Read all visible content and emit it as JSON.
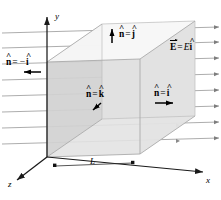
{
  "figure": {
    "type": "physics-diagram",
    "background_color": "#ffffff",
    "line_color": "#6e6e6e",
    "axis_color": "#1a1a1a",
    "cube_face_colors": {
      "top": "#f2f2f2",
      "front_right": "#e4e4e4",
      "left_shaded": "#cfcfcf",
      "inner_back": "#dcdcdc"
    }
  },
  "axes": [
    {
      "name": "y-axis",
      "label": "y",
      "direction": "up",
      "x": 160,
      "y": 10
    },
    {
      "name": "x-axis",
      "label": "x",
      "direction": "right",
      "x": 206,
      "y": 180
    },
    {
      "name": "z-axis",
      "label": "z",
      "direction": "down-left",
      "x": 10,
      "y": 182
    }
  ],
  "labels": {
    "normal_top": {
      "n": "n",
      "eq": "=",
      "v": "j",
      "hat_n": "^",
      "hat_v": "^",
      "x": 118,
      "y": 31
    },
    "normal_left": {
      "n": "n",
      "eq": "=",
      "minus": "−",
      "v": "i",
      "hat_n": "^",
      "hat_v": "^",
      "x": 6,
      "y": 60
    },
    "normal_front": {
      "n": "n",
      "eq": "=",
      "v": "k",
      "hat_n": "^",
      "hat_v": "^",
      "x": 86,
      "y": 92
    },
    "normal_right": {
      "n": "n",
      "eq": "=",
      "v": "i",
      "hat_n": "^",
      "hat_v": "^",
      "x": 154,
      "y": 91
    },
    "field_vector": {
      "E": "E",
      "eq": "=",
      "mag": "E",
      "v": "i",
      "hat_v": "^",
      "x": 170,
      "y": 45
    },
    "dimension_L": {
      "text": "L",
      "x": 93,
      "y": 161
    }
  },
  "field_lines": {
    "count": 8,
    "direction": "+x",
    "arrowheads_per_line": 2,
    "color": "#7d7d7d"
  },
  "indicator_arrows": [
    {
      "name": "arrow-normal-top",
      "points": "up"
    },
    {
      "name": "arrow-normal-left",
      "points": "left"
    },
    {
      "name": "arrow-normal-front",
      "points": "down-left"
    },
    {
      "name": "arrow-normal-right",
      "points": "right"
    }
  ]
}
